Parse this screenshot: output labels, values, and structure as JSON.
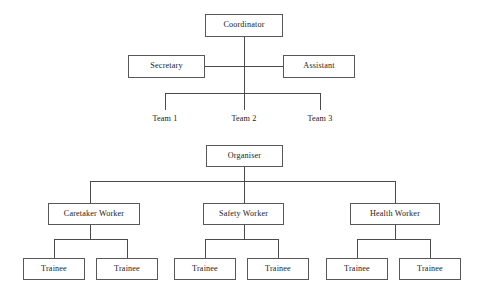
{
  "diagram": {
    "type": "organizational-chart",
    "background_color": "#ffffff",
    "line_color": "#4a4a4c",
    "box_border_color": "#58585a",
    "text_color": "#1a1a1a",
    "charts": [
      {
        "id": "upper-chart",
        "nodes": {
          "coordinator": "Coordinator",
          "secretary": "Secretary",
          "assistant": "Assistant",
          "team_1": "Team 1",
          "team_2": "Team 2",
          "team_3": "Team 3"
        }
      },
      {
        "id": "lower-chart",
        "nodes": {
          "organiser": "Organiser",
          "caretaker_worker": "Caretaker Worker",
          "safety_worker": "Safety Worker",
          "health_worker": "Health Worker",
          "trainee_1": "Trainee",
          "trainee_2": "Trainee",
          "trainee_3": "Trainee",
          "trainee_4": "Trainee",
          "trainee_5": "Trainee",
          "trainee_6": "Trainee"
        }
      }
    ]
  }
}
